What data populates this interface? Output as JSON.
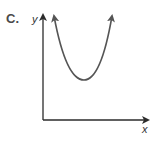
{
  "option_label": "C.",
  "diagram": {
    "type": "graph",
    "x_axis_label": "x",
    "y_axis_label": "y",
    "curve": "parabola opening upward",
    "vertex_position": "above x-axis, to the right of y-axis",
    "colors": {
      "axes": "#2b2b2b",
      "curve": "#555555",
      "text": "#4a4a4a"
    }
  }
}
